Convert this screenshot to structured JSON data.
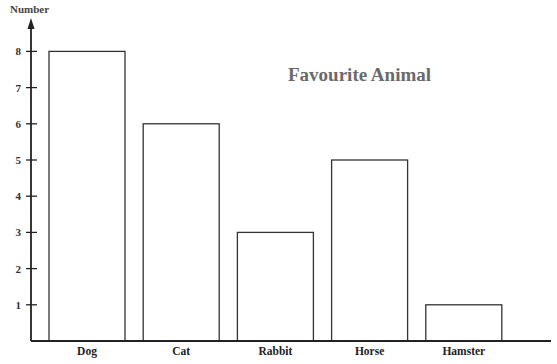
{
  "chart_data": {
    "type": "bar",
    "title": "Favourite Animal",
    "xlabel": "",
    "ylabel": "Number",
    "categories": [
      "Dog",
      "Cat",
      "Rabbit",
      "Horse",
      "Hamster"
    ],
    "values": [
      8,
      6,
      3,
      5,
      1
    ],
    "yticks": [
      1,
      2,
      3,
      4,
      5,
      6,
      7,
      8
    ],
    "ylim": [
      0,
      8.8
    ],
    "grid": false,
    "legend": null,
    "colors": {
      "bar_fill": "#ffffff",
      "bar_stroke": "#333333",
      "title": "#6a6a6a"
    }
  }
}
